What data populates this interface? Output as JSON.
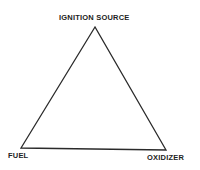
{
  "diagram": {
    "vertices": {
      "top": "IGNITION SOURCE",
      "bottom_left": "FUEL",
      "bottom_right": "OXIDIZER"
    },
    "colors": {
      "line": "#2a2a2a",
      "text": "#222222",
      "background": "#ffffff"
    }
  }
}
